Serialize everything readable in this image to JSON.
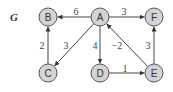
{
  "graph": {
    "title": "G",
    "nodes": [
      {
        "id": "A",
        "label": "A",
        "x": 100,
        "y": 17
      },
      {
        "id": "B",
        "label": "B",
        "x": 48,
        "y": 17
      },
      {
        "id": "F",
        "label": "F",
        "x": 154,
        "y": 17
      },
      {
        "id": "C",
        "label": "C",
        "x": 48,
        "y": 73
      },
      {
        "id": "D",
        "label": "D",
        "x": 100,
        "y": 73
      },
      {
        "id": "E",
        "label": "E",
        "x": 154,
        "y": 73
      }
    ],
    "edges": [
      {
        "from": "A",
        "to": "B",
        "weight": "6",
        "lx": 76,
        "ly": 11
      },
      {
        "from": "A",
        "to": "F",
        "weight": "3",
        "lx": 124,
        "ly": 11
      },
      {
        "from": "C",
        "to": "B",
        "weight": "2",
        "lx": 42,
        "ly": 45
      },
      {
        "from": "A",
        "to": "C",
        "weight": "3",
        "lx": 66,
        "ly": 45
      },
      {
        "from": "A",
        "to": "D",
        "weight": "4",
        "lx": 95,
        "ly": 45
      },
      {
        "from": "E",
        "to": "A",
        "weight": "−2",
        "lx": 117,
        "ly": 45
      },
      {
        "from": "D",
        "to": "E",
        "weight": "1",
        "lx": 125,
        "ly": 68
      },
      {
        "from": "E",
        "to": "F",
        "weight": "3",
        "lx": 148,
        "ly": 45
      }
    ]
  }
}
